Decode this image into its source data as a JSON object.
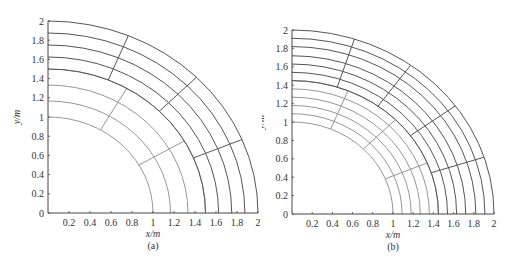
{
  "figure": {
    "panels": [
      {
        "id": "a",
        "caption": "(a)",
        "xlabel": "x/m",
        "ylabel": "y/m",
        "x_ticks": [
          "0.2",
          "0.4",
          "0.6",
          "0.8",
          "1",
          "1.2",
          "1.4",
          "1.6",
          "1.8",
          "2"
        ],
        "y_ticks": [
          "0",
          "0.2",
          "0.4",
          "0.6",
          "0.8",
          "1",
          "1.2",
          "1.4",
          "1.6",
          "1.8",
          "2"
        ],
        "inner_block": {
          "radii": [
            1.0,
            1.167,
            1.333,
            1.5
          ],
          "sector_angles_deg": [
            30,
            60
          ],
          "color": "#8a8a8a"
        },
        "outer_block": {
          "radii": [
            1.5,
            1.625,
            1.75,
            1.875,
            2.0
          ],
          "sector_angles_deg": [
            22.5,
            45,
            67.5
          ],
          "color": "#555555"
        }
      },
      {
        "id": "b",
        "caption": "(b)",
        "xlabel": "x/m",
        "ylabel": "y/m",
        "x_ticks": [
          "0.2",
          "0.4",
          "0.6",
          "0.8",
          "1",
          "1.2",
          "1.4",
          "1.6",
          "1.8",
          "2"
        ],
        "y_ticks": [
          "0",
          "0.2",
          "0.4",
          "0.6",
          "0.8",
          "1",
          "1.2",
          "1.4",
          "1.6",
          "1.8",
          "2"
        ],
        "inner_block": {
          "radii": [
            1.0,
            1.09,
            1.18,
            1.27,
            1.36,
            1.45
          ],
          "sector_angles_deg": [
            22.5,
            45,
            67.5
          ],
          "color": "#8a8a8a"
        },
        "outer_block": {
          "radii": [
            1.45,
            1.54,
            1.63,
            1.72,
            1.82,
            1.91,
            2.0
          ],
          "sector_angles_deg": [
            18,
            36,
            54,
            72
          ],
          "color": "#555555"
        }
      }
    ]
  }
}
